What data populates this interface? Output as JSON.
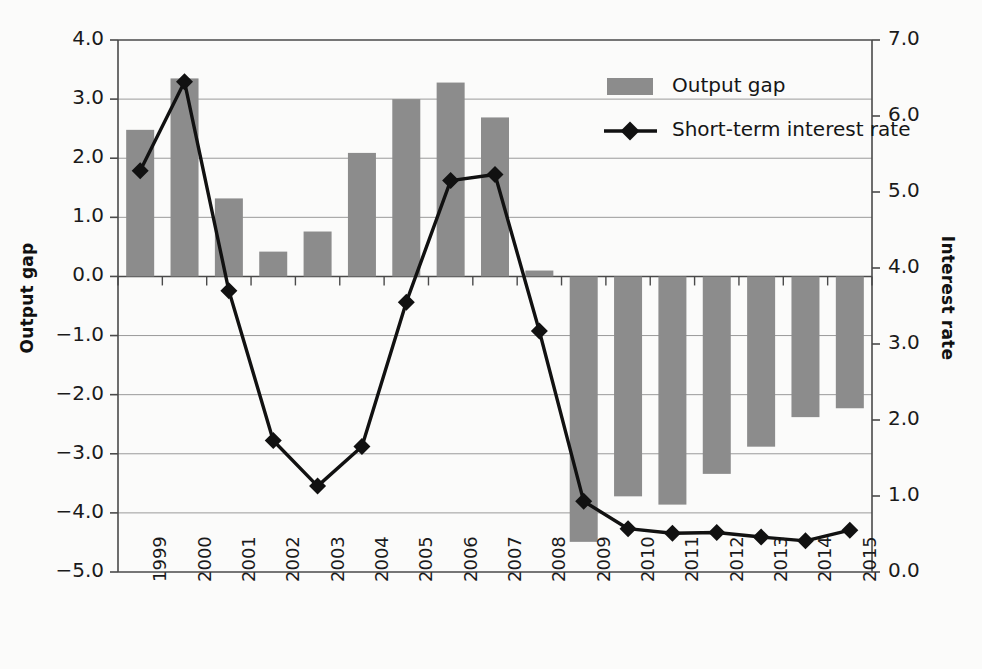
{
  "chart_data": {
    "type": "bar",
    "title": "",
    "subtitle": "",
    "xlabel": "",
    "ylabel": "Output gap",
    "y2label": "Interest rate",
    "categories": [
      "1999",
      "2000",
      "2001",
      "2002",
      "2003",
      "2004",
      "2005",
      "2006",
      "2007",
      "2008",
      "2009",
      "2010",
      "2011",
      "2012",
      "2013",
      "2014",
      "2015"
    ],
    "ylim": [
      -5.0,
      4.0
    ],
    "y2lim": [
      0.0,
      7.0
    ],
    "yticks": [
      "4.0",
      "3.0",
      "2.0",
      "1.0",
      "0.0",
      "−1.0",
      "−2.0",
      "−3.0",
      "−4.0",
      "−5.0"
    ],
    "ytick_values": [
      4.0,
      3.0,
      2.0,
      1.0,
      0.0,
      -1.0,
      -2.0,
      -3.0,
      -4.0,
      -5.0
    ],
    "y2ticks": [
      "7.0",
      "6.0",
      "5.0",
      "4.0",
      "3.0",
      "2.0",
      "1.0",
      "0.0"
    ],
    "y2tick_values": [
      7.0,
      6.0,
      5.0,
      4.0,
      3.0,
      2.0,
      1.0,
      0.0
    ],
    "grid": true,
    "legend_position": "top-center",
    "series": [
      {
        "name": "Output gap",
        "type": "bar",
        "axis": "left",
        "color": "#8c8c8c",
        "values": [
          2.48,
          3.35,
          1.32,
          0.42,
          0.76,
          2.09,
          3.0,
          3.28,
          2.69,
          0.1,
          -4.49,
          -3.72,
          -3.86,
          -3.34,
          -2.88,
          -2.38,
          -2.23
        ]
      },
      {
        "name": "Short-term interest rate",
        "type": "line",
        "axis": "right",
        "color": "#111111",
        "marker": "diamond",
        "values": [
          5.28,
          6.45,
          3.7,
          1.73,
          1.13,
          1.65,
          3.55,
          5.15,
          5.23,
          3.17,
          0.93,
          0.57,
          0.51,
          0.52,
          0.46,
          0.41,
          0.55
        ]
      }
    ]
  },
  "legend": {
    "items": [
      {
        "label": "Output gap",
        "marker": "bar-swatch"
      },
      {
        "label": "Short-term interest rate",
        "marker": "line-diamond"
      }
    ]
  },
  "axes": {
    "left_title": "Output gap",
    "right_title": "Interest rate"
  },
  "colors": {
    "bar": "#8c8c8c",
    "line": "#111111",
    "grid": "#9a9a9a",
    "axis": "#4a4a4a",
    "background": "#fbfbfa"
  }
}
